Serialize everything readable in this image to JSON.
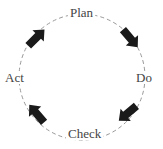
{
  "diagram": {
    "type": "cycle",
    "direction": "clockwise",
    "stages": [
      {
        "id": "plan",
        "label": "Plan",
        "position": "top"
      },
      {
        "id": "do",
        "label": "Do",
        "position": "right"
      },
      {
        "id": "check",
        "label": "Check",
        "position": "bottom"
      },
      {
        "id": "act",
        "label": "Act",
        "position": "left"
      }
    ],
    "arrows": [
      {
        "from": "Plan",
        "to": "Do",
        "icon": "arrow-down-right-icon"
      },
      {
        "from": "Do",
        "to": "Check",
        "icon": "arrow-down-left-icon"
      },
      {
        "from": "Check",
        "to": "Act",
        "icon": "arrow-up-left-icon"
      },
      {
        "from": "Act",
        "to": "Plan",
        "icon": "arrow-up-right-icon"
      }
    ],
    "colors": {
      "circle": "#999999",
      "arrow": "#1a1a1a",
      "text": "#444444",
      "background": "#ffffff"
    }
  }
}
